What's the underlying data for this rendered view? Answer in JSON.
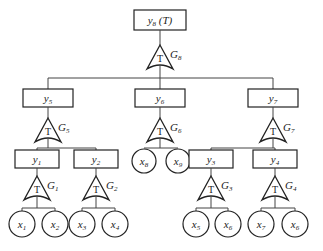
{
  "diagram": {
    "type": "fault-tree",
    "gate_symbol": "T",
    "top": {
      "id": "y8",
      "label": "y8 (T)",
      "gate": "G8",
      "children": [
        "y5",
        "y6",
        "y7"
      ]
    },
    "events": [
      {
        "id": "y5",
        "label": "y5",
        "gate": "G5",
        "children": [
          "y1",
          "y2"
        ]
      },
      {
        "id": "y6",
        "label": "y6",
        "gate": "G6",
        "children": [
          "x8",
          "x9"
        ]
      },
      {
        "id": "y7",
        "label": "y7",
        "gate": "G7",
        "children": [
          "y3",
          "y4"
        ]
      },
      {
        "id": "y1",
        "label": "y1",
        "gate": "G1",
        "children": [
          "x1",
          "x2"
        ]
      },
      {
        "id": "y2",
        "label": "y2",
        "gate": "G2",
        "children": [
          "x3",
          "x4"
        ]
      },
      {
        "id": "y3",
        "label": "y3",
        "gate": "G3",
        "children": [
          "x5",
          "x6"
        ]
      },
      {
        "id": "y4",
        "label": "y4",
        "gate": "G4",
        "children": [
          "x7",
          "x6"
        ]
      }
    ],
    "basic_events": [
      "x1",
      "x2",
      "x3",
      "x4",
      "x5",
      "x6",
      "x8",
      "x9",
      "x7",
      "x6"
    ]
  }
}
